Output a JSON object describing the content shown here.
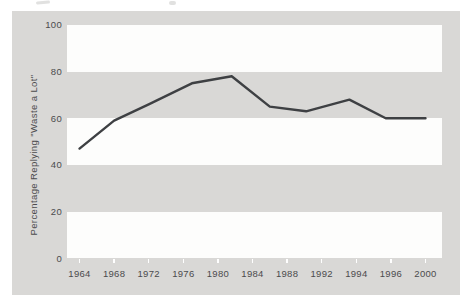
{
  "figure": {
    "kind": "scanned-book-line-chart",
    "caption_visible": false
  },
  "chart_data": {
    "type": "line",
    "title": "",
    "xlabel": "",
    "ylabel": "Percentage Replying \"Waste a Lot\"",
    "ylim": [
      0,
      100
    ],
    "y_ticks": [
      0,
      20,
      40,
      60,
      80,
      100
    ],
    "categories": [
      "1964",
      "1968",
      "1972",
      "1976",
      "1980",
      "1984",
      "1988",
      "1992",
      "1994",
      "1996",
      "2000"
    ],
    "x_axis_style": "categorical-equal-spacing",
    "legend": "none",
    "grid": "alternating horizontal white bands on gray background",
    "white_band_value_ranges": [
      [
        80,
        100
      ],
      [
        40,
        60
      ],
      [
        0,
        20
      ]
    ],
    "series": [
      {
        "name": "Percentage replying \"waste a lot\"",
        "points": [
          {
            "year": 1964,
            "slot": 0,
            "value": 47
          },
          {
            "year": 1968,
            "slot": 1,
            "value": 59
          },
          {
            "year": 1972,
            "slot": 2,
            "value": 66
          },
          {
            "year": 1977,
            "slot": 3.25,
            "value": 75
          },
          {
            "year": 1982,
            "slot": 4.4,
            "value": 78
          },
          {
            "year": 1986,
            "slot": 5.5,
            "value": 65
          },
          {
            "year": 1990,
            "slot": 6.55,
            "value": 63
          },
          {
            "year": 1993,
            "slot": 7.8,
            "value": 68
          },
          {
            "year": 1996,
            "slot": 8.85,
            "value": 60
          },
          {
            "year": 2000,
            "slot": 10,
            "value": 60
          }
        ]
      }
    ],
    "colors": {
      "page_bg": "#ffffff",
      "chart_bg": "#d9d8d6",
      "band": "#fdfdfc",
      "line": "#3e4043",
      "text": "#4b4b4d",
      "tick_mark": "#ffffff"
    }
  }
}
